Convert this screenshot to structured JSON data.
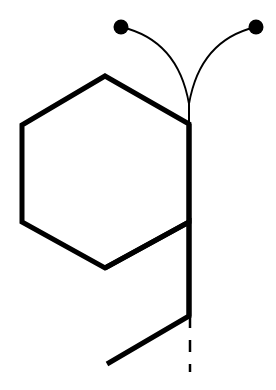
{
  "diagram": {
    "stroke_color": "#000000",
    "background": "#ffffff",
    "hexagon": {
      "points": [
        [
          105,
          76
        ],
        [
          189,
          124
        ],
        [
          189,
          222
        ],
        [
          105,
          268
        ],
        [
          22,
          222
        ],
        [
          22,
          125
        ]
      ],
      "stroke_width": 5
    },
    "four_ring": {
      "points": [
        [
          105,
          268
        ],
        [
          189,
          222
        ],
        [
          189,
          316
        ],
        [
          107,
          364
        ]
      ],
      "stroke_width": 5
    },
    "shared_bond": {
      "x": 189,
      "y1": 124,
      "y2": 316,
      "stroke_width": 5
    },
    "dashed_extension": {
      "x": 190,
      "y1": 316,
      "y2": 372,
      "dash": "12 12",
      "stroke_width": 2.5
    },
    "stem": {
      "x": 189,
      "y1": 100,
      "y2": 124,
      "stroke_width": 2
    },
    "curves": [
      {
        "name": "left-arc",
        "path": "M121,27 Q178,40 189,104",
        "stroke_width": 1.8
      },
      {
        "name": "right-arc",
        "path": "M256,27 Q200,40 189,104",
        "stroke_width": 1.8
      }
    ],
    "dots": [
      {
        "name": "left-dot",
        "cx": 121,
        "cy": 27,
        "r": 7.5
      },
      {
        "name": "right-dot",
        "cx": 256,
        "cy": 27,
        "r": 7.5
      }
    ]
  }
}
